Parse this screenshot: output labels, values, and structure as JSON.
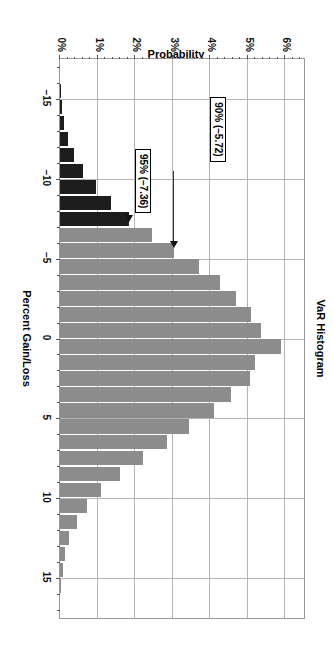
{
  "chart_data": {
    "type": "bar",
    "title": "VaR Histogram",
    "xlabel": "Percent Gain/Loss",
    "ylabel": "Probability",
    "orientation": "rotated-90-cw",
    "grid": true,
    "legend": "none",
    "xlim": [
      -17.5,
      17.5
    ],
    "ylim": [
      0,
      6.5
    ],
    "xticks": [
      -15,
      -10,
      -5,
      0,
      5,
      10,
      15
    ],
    "xtick_labels": [
      "–15",
      "–10",
      "–5",
      "0",
      "5",
      "10",
      "15"
    ],
    "yticks": [
      0,
      1,
      2,
      3,
      4,
      5,
      6
    ],
    "ytick_labels": [
      "0%",
      "1%",
      "2%",
      "3%",
      "4%",
      "5%",
      "6%"
    ],
    "bar_color": "#8c8c8c",
    "tail_color": "#1d1d1d",
    "tail_threshold": -7.36,
    "x": [
      -15.5,
      -14.5,
      -13.5,
      -12.5,
      -11.5,
      -10.5,
      -9.5,
      -8.5,
      -7.5,
      -6.5,
      -5.5,
      -4.5,
      -3.5,
      -2.5,
      -1.5,
      -0.5,
      0.5,
      1.5,
      2.5,
      3.5,
      4.5,
      5.5,
      6.5,
      7.5,
      8.5,
      9.5,
      10.5,
      11.5,
      12.5,
      13.5,
      14.5,
      15.5
    ],
    "values": [
      0.04,
      0.06,
      0.12,
      0.22,
      0.38,
      0.62,
      0.95,
      1.35,
      1.85,
      2.45,
      3.05,
      3.7,
      4.25,
      4.7,
      5.1,
      5.35,
      5.9,
      5.2,
      5.05,
      4.55,
      4.1,
      3.45,
      2.85,
      2.2,
      1.6,
      1.1,
      0.72,
      0.44,
      0.25,
      0.14,
      0.07,
      0.03
    ],
    "annotations": [
      {
        "label": "90% (–5.72)",
        "x": -5.72,
        "y": 3.05
      },
      {
        "label": "95% (–7.36)",
        "x": -7.36,
        "y": 1.85
      }
    ]
  },
  "axes": {
    "title": "VaR Histogram",
    "x_title": "Percent Gain/Loss",
    "y_title": "Probability"
  }
}
